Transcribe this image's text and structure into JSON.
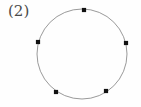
{
  "figure": {
    "label": "(2)",
    "label_x": 8,
    "label_y": 4,
    "background_color": "#fefefe",
    "width": 141,
    "height": 107
  },
  "chart_data": {
    "type": "scatter",
    "title": "(2)",
    "subtitle": "",
    "xlabel": "",
    "ylabel": "",
    "grid": false,
    "legend": "none",
    "axes_visible": false,
    "shapes": [
      {
        "name": "circle-outline",
        "kind": "circle",
        "cx": 82,
        "cy": 54,
        "r": 45,
        "stroke": "#9a9a9a",
        "stroke_width": 1,
        "fill": "none"
      }
    ],
    "point_style": {
      "marker": "square-dot",
      "size": 4.2,
      "color": "#111111"
    },
    "points": [
      {
        "id": "p1",
        "label": "top",
        "x": 84,
        "y": 10,
        "angle_deg": 87
      },
      {
        "id": "p2",
        "label": "right",
        "x": 126,
        "y": 43,
        "angle_deg": 14
      },
      {
        "id": "p3",
        "label": "bottom-right",
        "x": 106,
        "y": 91,
        "angle_deg": -57
      },
      {
        "id": "p4",
        "label": "bottom-left",
        "x": 56,
        "y": 92,
        "angle_deg": -124
      },
      {
        "id": "p5",
        "label": "left",
        "x": 38,
        "y": 42,
        "angle_deg": 165
      }
    ],
    "point_count": 5
  }
}
